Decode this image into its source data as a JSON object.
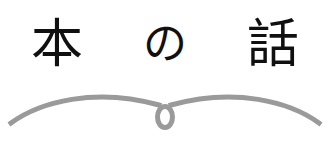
{
  "graphic": {
    "kind": "book-title-logo",
    "background_color": "#ffffff",
    "title": {
      "full_text": "本 の 話",
      "reading": "hon no hanashi",
      "text_color": "#101010",
      "characters": [
        {
          "glyph": "本",
          "script": "kanji"
        },
        {
          "glyph": "の",
          "script": "kana"
        },
        {
          "glyph": "話",
          "script": "kanji"
        }
      ]
    },
    "ornament": {
      "name": "open-book-swoosh",
      "stroke_color": "#9a9a9a",
      "stroke_width": 5,
      "loop_label": "center-loop",
      "description": "two symmetric arcs meeting at a small vertical loop"
    }
  }
}
